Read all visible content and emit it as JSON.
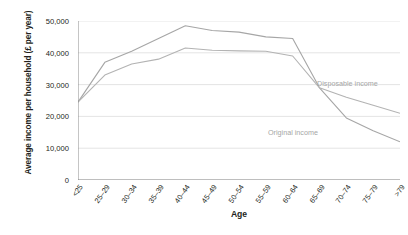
{
  "chart_data": {
    "type": "line",
    "title": "",
    "xlabel": "Age",
    "ylabel": "Average income per household (£ per year)",
    "categories": [
      "<25",
      "25–29",
      "30–34",
      "35–39",
      "40–44",
      "45–49",
      "50–54",
      "55–59",
      "60–64",
      "65–69",
      "70–74",
      "75–79",
      ">79"
    ],
    "ylim": [
      0,
      50000
    ],
    "ytick_values": [
      0,
      10000,
      20000,
      30000,
      40000,
      50000
    ],
    "ytick_labels": [
      "0",
      "10,000",
      "20,000",
      "30,000",
      "40,000",
      "50,000"
    ],
    "grid": "horizontal",
    "legend_position": "inline-annotations",
    "series": [
      {
        "name": "Original income",
        "color": "#a6a6a6",
        "values": [
          24500,
          37000,
          40500,
          44500,
          48500,
          47000,
          46500,
          45000,
          44500,
          29000,
          19500,
          15500,
          12000
        ]
      },
      {
        "name": "Disposable income",
        "color": "#b3b3b3",
        "values": [
          24500,
          33000,
          36500,
          38000,
          41500,
          40800,
          40600,
          40500,
          39000,
          29000,
          26000,
          23500,
          21000
        ]
      }
    ],
    "annotations": [
      {
        "text": "Disposable income",
        "series": "Disposable income"
      },
      {
        "text": "Original income",
        "series": "Original income"
      }
    ]
  },
  "axes": {
    "y_title": "Average income per household (£ per year)",
    "x_title": "Age"
  },
  "colors": {
    "background": "#ffffff",
    "axis": "#808080",
    "grid": "#d9d9d9",
    "text": "#231f20",
    "series_original": "#a6a6a6",
    "series_disposable": "#bfbfbf",
    "annotation_text": "#a6a6a6"
  }
}
